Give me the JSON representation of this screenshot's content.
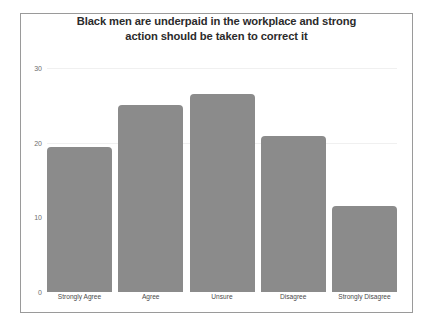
{
  "chart_data": {
    "type": "bar",
    "title": "Black men are underpaid in the workplace and strong action should be taken to correct it",
    "title_lines": [
      "Black men are underpaid in the workplace and strong",
      "action should be taken to correct it"
    ],
    "categories": [
      "Strongly Agree",
      "Agree",
      "Unsure",
      "Disagree",
      "Strongly Disagree"
    ],
    "values": [
      19,
      24.5,
      26,
      20.5,
      11.3
    ],
    "xlabel": "",
    "ylabel": "",
    "ylim": [
      0,
      30.4
    ],
    "yticks": [
      "0",
      "10",
      "20",
      "30"
    ],
    "ytick_values": [
      0,
      10,
      20,
      30
    ],
    "grid": true,
    "gridlines_at": [
      20,
      30
    ],
    "legend": null,
    "bar_color": "#8b8b8b",
    "grid_color": "#f0f0f0",
    "frame_color": "#9a9a9a",
    "title_color": "#2b2b2b",
    "tick_color": "#6e6e6e"
  }
}
